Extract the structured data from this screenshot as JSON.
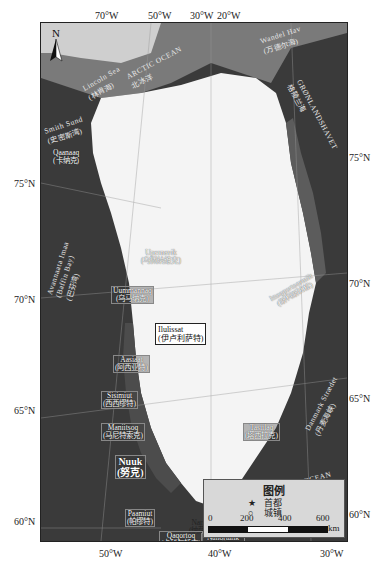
{
  "map": {
    "title": "Greenland",
    "style": "grayscale satellite",
    "colors": {
      "ocean": "#3a3a3a",
      "ice_sheet": "#f4f4f4",
      "coast_rock": "#5a5a5a",
      "legend_bg": "#d8d8d8"
    }
  },
  "axes": {
    "top_longitudes": [
      "70°W",
      "50°W",
      "30°W",
      "20°W"
    ],
    "bottom_longitudes": [
      "50°W",
      "40°W",
      "30°W"
    ],
    "left_latitudes": [
      "75°N",
      "70°N",
      "65°N",
      "60°N"
    ],
    "right_latitudes": [
      "80°N",
      "75°N",
      "70°N",
      "65°N",
      "60°N"
    ]
  },
  "north_arrow": {
    "label": "N"
  },
  "seas": [
    {
      "en": "ARCTIC",
      "zh": "北冰洋",
      "en2": "OCEAN"
    },
    {
      "en": "Wandel Hav",
      "zh": "(万德尔海)"
    },
    {
      "en": "GRØNLANDSHAVET",
      "zh": "格陵兰海"
    },
    {
      "en": "Smith Sund",
      "zh": "(史密斯湾)"
    },
    {
      "en": "Avannaata Imaa",
      "zh": "(Baffin Bay)",
      "zh2": "(巴芬湾)"
    },
    {
      "en": "Danmark Strædet",
      "zh": "(丹麦海峡)"
    },
    {
      "en": "ATLANTIC",
      "en2": "OCEAN",
      "zh": "大西洋"
    },
    {
      "en": "Lincoln Sea",
      "zh": "(林肯海)"
    }
  ],
  "places": [
    {
      "en": "Qaanaaq",
      "zh": "(卡纳克)"
    },
    {
      "en": "Upernavik",
      "zh": "(乌佩纳维克)"
    },
    {
      "en": "Uummannaq",
      "zh": "(乌马纳克)"
    },
    {
      "en": "Ilulissat",
      "zh": "(伊卢利萨特)"
    },
    {
      "en": "Aasiaat",
      "zh": "(阿西亚特)"
    },
    {
      "en": "Sisimiut",
      "zh": "(西西缪特)"
    },
    {
      "en": "Maniitsoq",
      "zh": "(马尼特索克)"
    },
    {
      "en": "Nuuk",
      "zh": "(努克)"
    },
    {
      "en": "Paamiut",
      "zh": "(帕缪特)"
    },
    {
      "en": "Narsaq",
      "zh": "(纳萨克)"
    },
    {
      "en": "Qaqortoq",
      "zh": "(卡科尔托克)"
    },
    {
      "en": "Nanortalik",
      "zh": "(纳诺塔利克)"
    },
    {
      "en": "Ittoqqortoormiit",
      "zh": "(斯科斯比松)"
    },
    {
      "en": "Tasiilaq",
      "zh": "(塔西拉克)"
    }
  ],
  "legend": {
    "title": "图例",
    "items": [
      {
        "symbol": "★",
        "label": "首都"
      },
      {
        "symbol": "○",
        "label": "城镇"
      }
    ],
    "scale": {
      "ticks": [
        "0",
        "200",
        "400",
        "600"
      ],
      "unit": "km"
    }
  }
}
